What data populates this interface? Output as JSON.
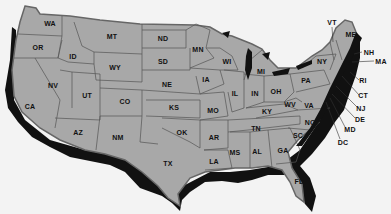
{
  "map": {
    "title": "United States map",
    "colors": {
      "background": "#f3f3f3",
      "land": "#a8a8a8",
      "border": "#555555",
      "shadow": "#111111",
      "label": "#111111",
      "water": "#111111"
    },
    "states": [
      {
        "abbr": "WA",
        "x": 50,
        "y": 23
      },
      {
        "abbr": "OR",
        "x": 38,
        "y": 47
      },
      {
        "abbr": "ID",
        "x": 73,
        "y": 56
      },
      {
        "abbr": "MT",
        "x": 112,
        "y": 36
      },
      {
        "abbr": "WY",
        "x": 115,
        "y": 67
      },
      {
        "abbr": "CA",
        "x": 30,
        "y": 106
      },
      {
        "abbr": "NV",
        "x": 53,
        "y": 85
      },
      {
        "abbr": "UT",
        "x": 87,
        "y": 95
      },
      {
        "abbr": "CO",
        "x": 125,
        "y": 101
      },
      {
        "abbr": "AZ",
        "x": 78,
        "y": 132
      },
      {
        "abbr": "NM",
        "x": 118,
        "y": 137
      },
      {
        "abbr": "ND",
        "x": 163,
        "y": 38
      },
      {
        "abbr": "SD",
        "x": 163,
        "y": 61
      },
      {
        "abbr": "NE",
        "x": 167,
        "y": 84
      },
      {
        "abbr": "KS",
        "x": 174,
        "y": 107
      },
      {
        "abbr": "OK",
        "x": 182,
        "y": 132
      },
      {
        "abbr": "TX",
        "x": 168,
        "y": 163
      },
      {
        "abbr": "MN",
        "x": 198,
        "y": 49
      },
      {
        "abbr": "IA",
        "x": 206,
        "y": 79
      },
      {
        "abbr": "MO",
        "x": 213,
        "y": 110
      },
      {
        "abbr": "AR",
        "x": 214,
        "y": 137
      },
      {
        "abbr": "LA",
        "x": 214,
        "y": 161
      },
      {
        "abbr": "WI",
        "x": 227,
        "y": 61
      },
      {
        "abbr": "IL",
        "x": 235,
        "y": 93
      },
      {
        "abbr": "MS",
        "x": 235,
        "y": 152
      },
      {
        "abbr": "MI",
        "x": 261,
        "y": 71
      },
      {
        "abbr": "IN",
        "x": 255,
        "y": 93
      },
      {
        "abbr": "OH",
        "x": 276,
        "y": 91
      },
      {
        "abbr": "KY",
        "x": 267,
        "y": 111
      },
      {
        "abbr": "TN",
        "x": 256,
        "y": 128
      },
      {
        "abbr": "AL",
        "x": 257,
        "y": 151
      },
      {
        "abbr": "GA",
        "x": 283,
        "y": 150
      },
      {
        "abbr": "FL",
        "x": 299,
        "y": 181
      },
      {
        "abbr": "SC",
        "x": 298,
        "y": 135
      },
      {
        "abbr": "NC",
        "x": 310,
        "y": 122
      },
      {
        "abbr": "VA",
        "x": 309,
        "y": 105
      },
      {
        "abbr": "WV",
        "x": 290,
        "y": 104
      },
      {
        "abbr": "PA",
        "x": 306,
        "y": 80
      },
      {
        "abbr": "NY",
        "x": 322,
        "y": 61
      },
      {
        "abbr": "ME",
        "x": 351,
        "y": 34
      }
    ],
    "callouts": [
      {
        "abbr": "VT",
        "x": 332,
        "y": 22
      },
      {
        "abbr": "NH",
        "x": 369,
        "y": 52
      },
      {
        "abbr": "MA",
        "x": 381,
        "y": 61
      },
      {
        "abbr": "RI",
        "x": 363,
        "y": 80
      },
      {
        "abbr": "CT",
        "x": 363,
        "y": 95
      },
      {
        "abbr": "NJ",
        "x": 361,
        "y": 108
      },
      {
        "abbr": "DE",
        "x": 360,
        "y": 119
      },
      {
        "abbr": "MD",
        "x": 350,
        "y": 129
      },
      {
        "abbr": "DC",
        "x": 343,
        "y": 142
      }
    ]
  }
}
